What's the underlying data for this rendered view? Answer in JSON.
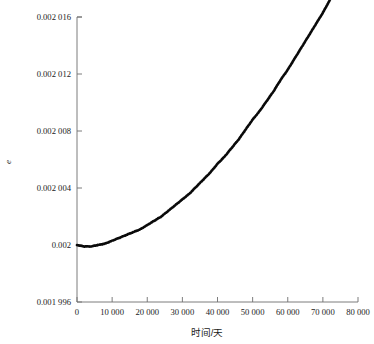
{
  "chart_data": {
    "type": "line",
    "title": "",
    "xlabel": "时间/天",
    "ylabel": "e",
    "xlim": [
      0,
      80000
    ],
    "ylim": [
      0.001996,
      0.002016
    ],
    "grid": false,
    "legend": null,
    "xticks": [
      0,
      10000,
      20000,
      30000,
      40000,
      50000,
      60000,
      70000,
      80000
    ],
    "xtick_labels": [
      "0",
      "10 000",
      "20 000",
      "30 000",
      "40 000",
      "50 000",
      "60 000",
      "70 000",
      "80 000"
    ],
    "yticks": [
      0.001996,
      0.002,
      0.002004,
      0.002008,
      0.002012,
      0.002016
    ],
    "ytick_labels": [
      "0.001 996",
      "0.002",
      "0.002 004",
      "0.002 008",
      "0.002 012",
      "0.002 016"
    ],
    "series": [
      {
        "name": "eccentricity",
        "color": "#0a0a0a",
        "line_width": 2.6,
        "x": [
          0,
          2000,
          4000,
          6000,
          8000,
          10000,
          12000,
          14000,
          16000,
          18000,
          20000,
          22000,
          24000,
          26000,
          28000,
          30000,
          32000,
          34000,
          36000,
          38000,
          40000,
          42000,
          44000,
          46000,
          48000,
          50000,
          52000,
          54000,
          56000,
          58000,
          60000,
          62000,
          64000,
          66000,
          68000,
          70000,
          72000,
          74000,
          76000,
          78000,
          80000
        ],
        "y": [
          0.002,
          0.0019999,
          0.0019999,
          0.002,
          0.0020001,
          0.0020003,
          0.0020005,
          0.0020007,
          0.0020009,
          0.0020011,
          0.0020014,
          0.0020017,
          0.002002,
          0.0020024,
          0.0020028,
          0.0020032,
          0.0020036,
          0.0020041,
          0.0020046,
          0.0020051,
          0.0020057,
          0.0020062,
          0.0020068,
          0.0020074,
          0.0020081,
          0.0020088,
          0.0020094,
          0.0020101,
          0.0020108,
          0.0020116,
          0.0020123,
          0.0020131,
          0.0020139,
          0.0020147,
          0.0020155,
          0.0020163,
          0.0020172,
          0.002018,
          0.0020189,
          0.0020198,
          0.0020207
        ]
      }
    ]
  },
  "axes": {
    "y_axis_label": "e",
    "x_axis_label": "时间/天"
  }
}
